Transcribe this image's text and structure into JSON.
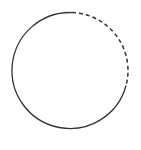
{
  "diagram": {
    "shape": "circle",
    "center": [
      70,
      70.5
    ],
    "radius": 58,
    "stroke_color": "#333333",
    "background": "#ffffff",
    "segments": [
      {
        "style": "solid",
        "from_deg": 15,
        "to_deg": 272
      },
      {
        "style": "dashed",
        "from_deg": 272,
        "to_deg": 375
      }
    ]
  }
}
